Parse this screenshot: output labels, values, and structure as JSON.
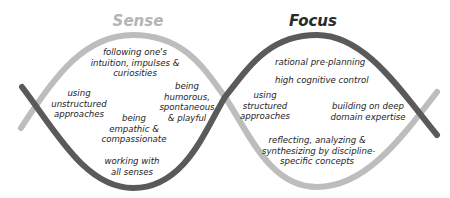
{
  "titles": {
    "sense": "Sense",
    "focus": "Focus"
  },
  "colors": {
    "sense_curve": "#bdbdbd",
    "focus_curve": "#5a5a5a",
    "sense_title": "#b4b4b4",
    "focus_title": "#2a2a2a",
    "text": "#1e1e1e"
  },
  "sense_labels": [
    {
      "line1": "following one's",
      "line2": "intuition, impulses &",
      "line3": "curiosities"
    },
    {
      "line1": "using",
      "line2": "unstructured",
      "line3": "approaches"
    },
    {
      "line1": "being",
      "line2": "humorous,",
      "line3": "spontaneous",
      "line4": "& playful"
    },
    {
      "line1": "being",
      "line2": "empathic &",
      "line3": "compassionate"
    },
    {
      "line1": "working with",
      "line2": "all senses"
    }
  ],
  "focus_labels": [
    {
      "line1": "rational pre-planning"
    },
    {
      "line1": "high cognitive control"
    },
    {
      "line1": "using",
      "line2": "structured",
      "line3": "approaches"
    },
    {
      "line1": "building on deep",
      "line2": "domain expertise"
    },
    {
      "line1": "reflecting, analyzing &",
      "line2": "synthesizing by discipline-",
      "line3": "specific concepts"
    }
  ]
}
